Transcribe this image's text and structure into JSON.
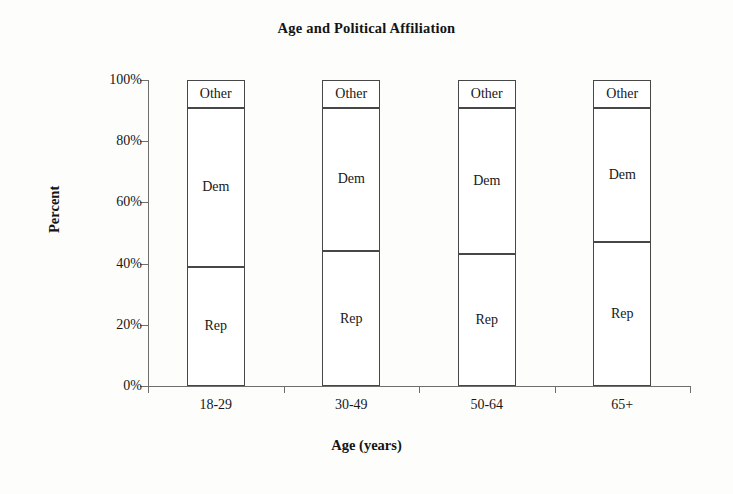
{
  "chart_data": {
    "type": "bar",
    "stacked": true,
    "stacked_total": 100,
    "title": "Age and Political Affiliation",
    "xlabel": "Age (years)",
    "ylabel": "Percent",
    "categories": [
      "18-29",
      "30-49",
      "50-64",
      "65+"
    ],
    "ylim": [
      0,
      100
    ],
    "ytick_values": [
      0,
      20,
      40,
      60,
      80,
      100
    ],
    "ytick_labels": [
      "0%",
      "20%",
      "40%",
      "60%",
      "80%",
      "100%"
    ],
    "grid": false,
    "legend": "none (segments labeled in place)",
    "series": [
      {
        "name": "Rep",
        "values": [
          39,
          44,
          43,
          47
        ]
      },
      {
        "name": "Dem",
        "values": [
          52,
          47,
          48,
          44
        ]
      },
      {
        "name": "Other",
        "values": [
          9,
          9,
          9,
          9
        ]
      }
    ],
    "segment_labels": [
      "Rep",
      "Dem",
      "Other"
    ],
    "boundaries_percent": {
      "18-29": [
        0,
        39,
        91,
        100
      ],
      "30-49": [
        0,
        44,
        91,
        100
      ],
      "50-64": [
        0,
        43,
        91,
        100
      ],
      "65+": [
        0,
        47,
        91,
        100
      ]
    },
    "colors": {
      "background": "#fdfdfc",
      "segment_fill": "#ffffff",
      "segment_stroke": "#474747",
      "axis": "#6e6e6e",
      "text": "#171717"
    }
  }
}
